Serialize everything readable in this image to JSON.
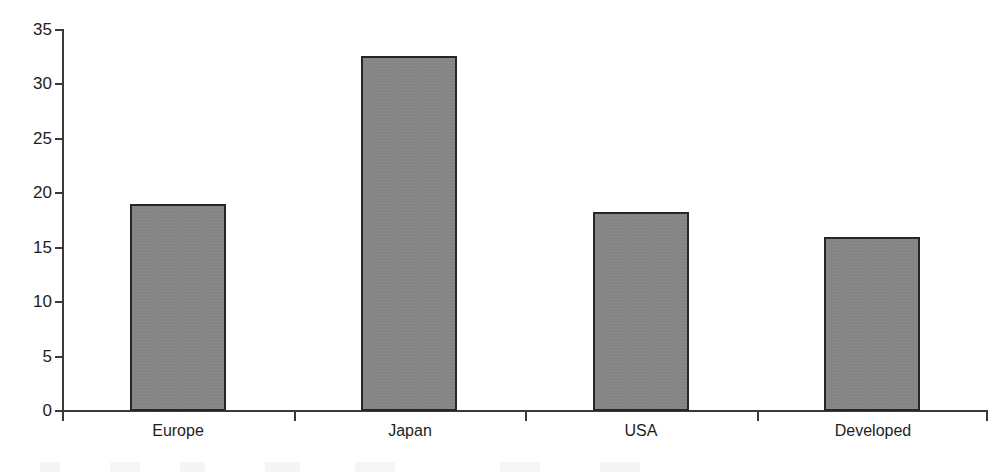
{
  "chart_data": {
    "type": "bar",
    "title": "",
    "subtitle": "",
    "xlabel": "",
    "ylabel": "",
    "categories": [
      "Europe",
      "Japan",
      "USA",
      "Developed"
    ],
    "values": [
      19.0,
      32.6,
      18.3,
      16.0
    ],
    "series": [
      {
        "name": "",
        "values": [
          19.0,
          32.6,
          18.3,
          16.0
        ]
      }
    ],
    "ylim": [
      0,
      35
    ],
    "y_ticks": [
      0,
      5,
      10,
      15,
      20,
      25,
      30,
      35
    ],
    "y_tick_labels": [
      "0",
      "5",
      "10",
      "15",
      "20",
      "25",
      "30",
      "35"
    ],
    "grid": false,
    "legend": false,
    "legend_position": "none",
    "annotations": [],
    "style": {
      "bar_fill": "#858585",
      "bar_border": "#262626",
      "axis_color": "#3a3a3a",
      "text_color": "#1d1d1d",
      "background": "#ffffff"
    }
  }
}
